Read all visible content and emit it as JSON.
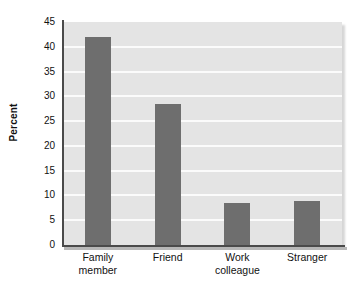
{
  "chart_data": {
    "type": "bar",
    "title": "",
    "xlabel": "",
    "ylabel": "Percent",
    "categories": [
      "Family member",
      "Friend",
      "Work colleague",
      "Stranger"
    ],
    "category_lines": [
      [
        "Family",
        "member"
      ],
      [
        "Friend"
      ],
      [
        "Work",
        "colleague"
      ],
      [
        "Stranger"
      ]
    ],
    "values": [
      42.0,
      28.4,
      8.5,
      8.8
    ],
    "ylim": [
      0,
      45
    ],
    "ytick_step": 5,
    "yticks": [
      0,
      5,
      10,
      15,
      20,
      25,
      30,
      35,
      40,
      45
    ],
    "ytick_labels": [
      "0",
      "5",
      "10",
      "15",
      "20",
      "25",
      "30",
      "35",
      "40",
      "45"
    ],
    "grid": "horizontal",
    "legend": "none",
    "bar_color": "#6e6e6e",
    "plot_background": "#e4e4e4",
    "gridline_color": "#fbfbfb",
    "axis_color": "#4a4a4a",
    "text_color": "#111111"
  }
}
